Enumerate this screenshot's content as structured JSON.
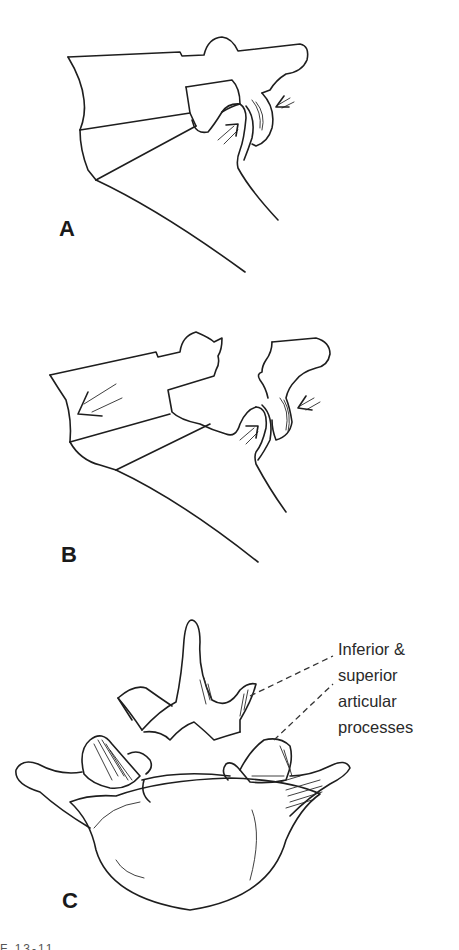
{
  "figure": {
    "panels": [
      {
        "id": "A",
        "label": "A",
        "description": "Lateral view of lumbosacral facet joint in neutral alignment with compressive arrows at joint"
      },
      {
        "id": "B",
        "label": "B",
        "description": "Lateral view showing anterior translation (large arrow) of upper vertebra with facet joint impaction arrows"
      },
      {
        "id": "C",
        "label": "C",
        "description": "Superior view of lumbar vertebra showing articular processes",
        "annotation": {
          "lines": [
            "Inferior &",
            "superior",
            "articular",
            "processes"
          ]
        }
      }
    ],
    "caption_fragment": "F  13-11"
  },
  "colors": {
    "ink": "#1e1e1e",
    "background": "#ffffff"
  }
}
